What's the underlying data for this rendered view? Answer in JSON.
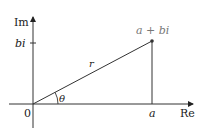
{
  "diagram": {
    "axes": {
      "real_label": "Re",
      "imag_label": "Im",
      "origin_label": "0"
    },
    "point": {
      "label": "a + bi",
      "x_label": "a",
      "y_label": "bi"
    },
    "radius_label": "r",
    "angle_label": "θ",
    "colors": {
      "line": "#333333",
      "point_label": "#777777"
    }
  }
}
